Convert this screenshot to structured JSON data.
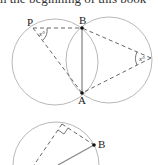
{
  "header_fragment": "n the beginning of this book",
  "diagram_top": {
    "points": {
      "P": "P",
      "B": "B",
      "A": "A"
    },
    "angle_label_left": "x°",
    "angle_label_right": "x°"
  },
  "diagram_bottom": {
    "points": {
      "B": "B"
    }
  },
  "colors": {
    "circle": "#b5b5b5",
    "dashed": "#666666",
    "solid": "#888888",
    "point": "#111111"
  }
}
